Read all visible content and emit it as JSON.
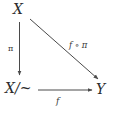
{
  "diagram": {
    "type": "commutative-diagram",
    "background_color": "#ffffff",
    "stroke_color": "#4a4a4a",
    "text_color": "#2b2b2b",
    "nodes": [
      {
        "id": "X",
        "label": "X",
        "position": "top-left"
      },
      {
        "id": "Xquot",
        "label": "X/~",
        "position": "bottom-left"
      },
      {
        "id": "Y",
        "label": "Y",
        "position": "bottom-right"
      }
    ],
    "edges": [
      {
        "id": "pi",
        "label": "π",
        "from": "X",
        "to": "Xquot",
        "direction": "down",
        "label_side": "left"
      },
      {
        "id": "f",
        "label": "f",
        "from": "Xquot",
        "to": "Y",
        "direction": "right",
        "label_side": "below"
      },
      {
        "id": "fcircpi",
        "label": "f ∘ π",
        "from": "X",
        "to": "Y",
        "direction": "diagonal",
        "label_side": "above-right"
      }
    ]
  }
}
